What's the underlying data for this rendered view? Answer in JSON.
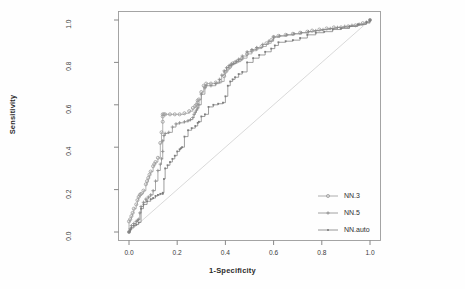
{
  "chart_data": {
    "type": "line",
    "title": "",
    "xlabel": "1-Specificity",
    "ylabel": "Sensitivity",
    "xlim": [
      0.0,
      1.0
    ],
    "ylim": [
      0.0,
      1.0
    ],
    "grid": false,
    "xticks": [
      "0.0",
      "0.2",
      "0.4",
      "0.6",
      "0.8",
      "1.0"
    ],
    "xtick_values": [
      0.0,
      0.2,
      0.4,
      0.6,
      0.8,
      1.0
    ],
    "yticks": [
      "0.0",
      "0.2",
      "0.4",
      "0.6",
      "0.8",
      "1.0"
    ],
    "ytick_values": [
      0.0,
      0.2,
      0.4,
      0.6,
      0.8,
      1.0
    ],
    "legend_position": "bottom-right",
    "reference_line": {
      "name": "chance-diagonal",
      "from": [
        0.0,
        0.0
      ],
      "to": [
        1.0,
        1.0
      ],
      "color": "#cfcfcf"
    },
    "series": [
      {
        "name": "NN.3",
        "color": "#9a9a9a",
        "marker": "circle",
        "x": [
          0.0,
          0.0,
          0.005,
          0.01,
          0.015,
          0.02,
          0.03,
          0.035,
          0.04,
          0.045,
          0.05,
          0.06,
          0.07,
          0.075,
          0.08,
          0.085,
          0.09,
          0.1,
          0.105,
          0.11,
          0.12,
          0.13,
          0.135,
          0.14,
          0.14,
          0.14,
          0.145,
          0.15,
          0.17,
          0.19,
          0.21,
          0.23,
          0.25,
          0.265,
          0.275,
          0.28,
          0.285,
          0.285,
          0.29,
          0.3,
          0.31,
          0.32,
          0.34,
          0.36,
          0.38,
          0.395,
          0.4,
          0.41,
          0.42,
          0.425,
          0.43,
          0.44,
          0.45,
          0.46,
          0.47,
          0.49,
          0.51,
          0.53,
          0.55,
          0.57,
          0.59,
          0.6,
          0.62,
          0.65,
          0.68,
          0.71,
          0.74,
          0.76,
          0.79,
          0.82,
          0.85,
          0.88,
          0.91,
          0.94,
          0.97,
          1.0
        ],
        "y": [
          0.0,
          0.05,
          0.06,
          0.075,
          0.09,
          0.11,
          0.13,
          0.15,
          0.165,
          0.175,
          0.18,
          0.195,
          0.225,
          0.24,
          0.255,
          0.27,
          0.285,
          0.31,
          0.32,
          0.33,
          0.35,
          0.42,
          0.47,
          0.52,
          0.545,
          0.555,
          0.555,
          0.555,
          0.555,
          0.555,
          0.555,
          0.56,
          0.57,
          0.585,
          0.595,
          0.6,
          0.61,
          0.62,
          0.625,
          0.66,
          0.69,
          0.7,
          0.7,
          0.705,
          0.71,
          0.735,
          0.755,
          0.77,
          0.78,
          0.79,
          0.795,
          0.8,
          0.805,
          0.81,
          0.82,
          0.84,
          0.855,
          0.865,
          0.875,
          0.89,
          0.905,
          0.92,
          0.925,
          0.93,
          0.935,
          0.94,
          0.945,
          0.95,
          0.955,
          0.96,
          0.965,
          0.965,
          0.97,
          0.975,
          0.985,
          1.0
        ]
      },
      {
        "name": "NN.5",
        "color": "#8c8c8c",
        "marker": "cross",
        "x": [
          0.0,
          0.005,
          0.01,
          0.02,
          0.03,
          0.035,
          0.04,
          0.045,
          0.05,
          0.06,
          0.07,
          0.08,
          0.09,
          0.1,
          0.11,
          0.12,
          0.13,
          0.135,
          0.14,
          0.14,
          0.145,
          0.15,
          0.165,
          0.18,
          0.195,
          0.21,
          0.23,
          0.245,
          0.255,
          0.265,
          0.27,
          0.275,
          0.28,
          0.285,
          0.29,
          0.3,
          0.315,
          0.32,
          0.34,
          0.36,
          0.375,
          0.385,
          0.395,
          0.405,
          0.415,
          0.425,
          0.435,
          0.445,
          0.455,
          0.47,
          0.49,
          0.51,
          0.53,
          0.555,
          0.58,
          0.6,
          0.625,
          0.655,
          0.685,
          0.715,
          0.745,
          0.775,
          0.805,
          0.835,
          0.865,
          0.895,
          0.925,
          0.955,
          0.985,
          1.0
        ],
        "y": [
          0.0,
          0.015,
          0.03,
          0.04,
          0.05,
          0.055,
          0.06,
          0.09,
          0.12,
          0.14,
          0.155,
          0.165,
          0.175,
          0.195,
          0.24,
          0.29,
          0.32,
          0.345,
          0.38,
          0.43,
          0.455,
          0.465,
          0.47,
          0.495,
          0.51,
          0.515,
          0.52,
          0.525,
          0.53,
          0.54,
          0.555,
          0.565,
          0.575,
          0.585,
          0.6,
          0.65,
          0.68,
          0.69,
          0.69,
          0.7,
          0.72,
          0.74,
          0.76,
          0.775,
          0.785,
          0.79,
          0.795,
          0.805,
          0.815,
          0.83,
          0.85,
          0.86,
          0.87,
          0.885,
          0.9,
          0.92,
          0.925,
          0.93,
          0.935,
          0.94,
          0.945,
          0.95,
          0.955,
          0.96,
          0.965,
          0.97,
          0.975,
          0.98,
          0.99,
          1.0
        ]
      },
      {
        "name": "NN.auto",
        "color": "#7d7d7d",
        "marker": "dot",
        "x": [
          0.0,
          0.005,
          0.01,
          0.02,
          0.03,
          0.04,
          0.05,
          0.06,
          0.075,
          0.09,
          0.1,
          0.11,
          0.12,
          0.13,
          0.14,
          0.14,
          0.145,
          0.15,
          0.16,
          0.17,
          0.18,
          0.19,
          0.2,
          0.21,
          0.215,
          0.22,
          0.23,
          0.245,
          0.26,
          0.275,
          0.285,
          0.29,
          0.3,
          0.315,
          0.33,
          0.35,
          0.37,
          0.39,
          0.4,
          0.41,
          0.42,
          0.43,
          0.44,
          0.455,
          0.47,
          0.49,
          0.515,
          0.54,
          0.565,
          0.59,
          0.605,
          0.62,
          0.65,
          0.68,
          0.71,
          0.74,
          0.775,
          0.81,
          0.845,
          0.88,
          0.915,
          0.95,
          0.985,
          1.0
        ],
        "y": [
          0.0,
          0.01,
          0.02,
          0.03,
          0.035,
          0.045,
          0.11,
          0.13,
          0.145,
          0.155,
          0.16,
          0.17,
          0.175,
          0.18,
          0.18,
          0.185,
          0.25,
          0.3,
          0.315,
          0.33,
          0.345,
          0.36,
          0.38,
          0.39,
          0.395,
          0.4,
          0.45,
          0.48,
          0.49,
          0.5,
          0.515,
          0.52,
          0.545,
          0.555,
          0.59,
          0.6,
          0.605,
          0.61,
          0.64,
          0.69,
          0.71,
          0.72,
          0.73,
          0.745,
          0.755,
          0.8,
          0.82,
          0.835,
          0.85,
          0.865,
          0.88,
          0.895,
          0.9,
          0.905,
          0.915,
          0.93,
          0.94,
          0.945,
          0.955,
          0.96,
          0.97,
          0.98,
          0.99,
          1.0
        ]
      }
    ]
  },
  "legend": {
    "items": [
      {
        "label": "NN.3"
      },
      {
        "label": "NN.5"
      },
      {
        "label": "NN.auto"
      }
    ]
  }
}
